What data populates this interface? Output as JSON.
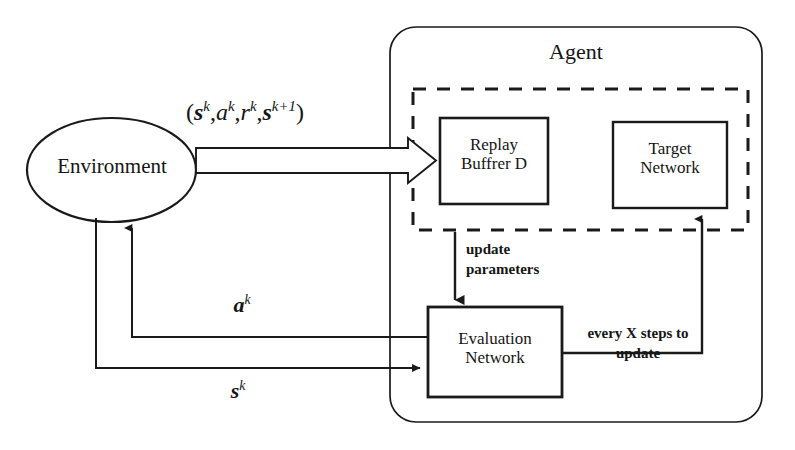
{
  "diagram": {
    "agent": {
      "label": "Agent",
      "inner_group_style": "dashed",
      "blocks": [
        {
          "id": "replay-buffer",
          "label_line1": "Replay",
          "label_line2": "Buffrer D"
        },
        {
          "id": "target-network",
          "label_line1": "Target",
          "label_line2": "Network"
        },
        {
          "id": "evaluation-network",
          "label_line1": "Evaluation",
          "label_line2": "Network"
        }
      ]
    },
    "environment": {
      "label": "Environment"
    },
    "edges": {
      "transition_tuple": {
        "open": "(",
        "s_k": "s",
        "s_k_sup": "k",
        "comma1": ",",
        "a_k": "a",
        "a_k_sup": "k",
        "comma2": ",",
        "r_k": "r",
        "r_k_sup": "k",
        "comma3": ",",
        "s_k1": "s",
        "s_k1_sup": "k+1",
        "close": ")"
      },
      "action": {
        "symbol": "a",
        "sup": "k"
      },
      "state": {
        "symbol": "s",
        "sup": "k"
      },
      "update_parameters": {
        "line1": "update",
        "line2": "parameters"
      },
      "target_sync": {
        "line1": "every X steps to",
        "line2": "update"
      }
    }
  },
  "colors": {
    "stroke": "#1a1a1a",
    "background": "#ffffff",
    "text": "#151515"
  }
}
